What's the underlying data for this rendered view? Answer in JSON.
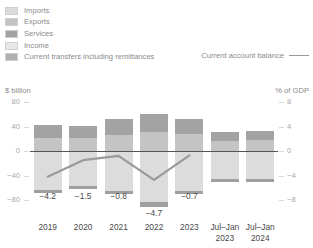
{
  "legend": {
    "items": [
      {
        "label": "Imports",
        "color": "#dcdcdc",
        "swatch_name": "legend-swatch-imports"
      },
      {
        "label": "Exports",
        "color": "#c4c4c4",
        "swatch_name": "legend-swatch-exports"
      },
      {
        "label": "Services",
        "color": "#a3a3a3",
        "swatch_name": "legend-swatch-services"
      },
      {
        "label": "Income",
        "color": "#e8e8e8",
        "swatch_name": "legend-swatch-income"
      },
      {
        "label": "Current transfers including remittances",
        "color": "#b0b0b0",
        "swatch_name": "legend-swatch-current-transfers"
      }
    ],
    "line_item": {
      "label": "Current account balance",
      "color": "#9a9a9a"
    }
  },
  "axes": {
    "left_title": "$ billion",
    "right_title": "% of GDP",
    "left_ticks": [
      "80",
      "40",
      "0",
      "-40",
      "-80"
    ],
    "right_ticks": [
      "8",
      "4",
      "0",
      "-4",
      "-8"
    ]
  },
  "chart_data": {
    "type": "bar",
    "title": "",
    "xlabel": "",
    "ylabel": "$ billion",
    "y2label": "% of GDP",
    "ylim": [
      -80,
      80
    ],
    "y2lim": [
      -8,
      8
    ],
    "yticks": [
      80,
      40,
      0,
      -40,
      -80
    ],
    "y2ticks": [
      8,
      4,
      0,
      -4,
      -8
    ],
    "grid": false,
    "legend_position": "top",
    "categories": [
      "2019",
      "2020",
      "2021",
      "2022",
      "2023",
      "Jul-Jan 2023",
      "Jul-Jan 2024"
    ],
    "category_lines": [
      [
        "2019"
      ],
      [
        "2020"
      ],
      [
        "2021"
      ],
      [
        "2022"
      ],
      [
        "2023"
      ],
      [
        "Jul–Jan",
        "2023"
      ],
      [
        "Jul–Jan",
        "2024"
      ]
    ],
    "stacked": true,
    "series": [
      {
        "name": "Exports",
        "color": "#c4c4c4",
        "values": [
          22,
          21,
          26,
          31,
          27,
          17,
          18
        ]
      },
      {
        "name": "Services",
        "color": "#a3a3a3",
        "values": [
          20,
          20,
          26,
          29,
          25,
          14,
          14
        ]
      },
      {
        "name": "Current transfers including remittances",
        "color": "#b0b0b0",
        "values": [
          0,
          0,
          0,
          0,
          0,
          0,
          0
        ]
      },
      {
        "name": "Imports",
        "color": "#dcdcdc",
        "values": [
          -63,
          -57,
          -65,
          -84,
          -65,
          -46,
          -46
        ]
      },
      {
        "name": "Income",
        "color": "#9f9f9f",
        "values": [
          -6,
          -5,
          -6,
          -7,
          -6,
          -4,
          -4
        ]
      }
    ],
    "line_series": {
      "name": "Current account balance",
      "color": "#9a9a9a",
      "unit": "% of GDP",
      "x": [
        "2019",
        "2020",
        "2021",
        "2022",
        "2023"
      ],
      "values": [
        -4.2,
        -1.5,
        -0.8,
        -4.7,
        -0.7
      ],
      "labels": [
        "−4.2",
        "−1.5",
        "−0.8",
        "−4.7",
        "−0.7"
      ]
    }
  }
}
